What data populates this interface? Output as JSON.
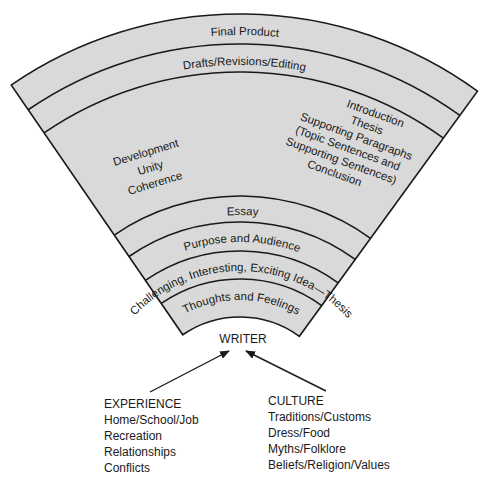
{
  "diagram": {
    "colors": {
      "band_fill": "#d9d9d9",
      "line": "#1a1a1a",
      "text": "#1a1a1a"
    },
    "bands_outer_to_inner": [
      {
        "id": "final-product",
        "label": "Final Product"
      },
      {
        "id": "drafts",
        "label": "Drafts/Revisions/Editing"
      },
      {
        "id": "structure",
        "label": ""
      },
      {
        "id": "essay",
        "label": "Essay"
      },
      {
        "id": "purpose",
        "label": "Purpose and Audience"
      },
      {
        "id": "idea",
        "label": "Challenging, Interesting, Exciting Idea—Thesis"
      },
      {
        "id": "thoughts",
        "label": "Thoughts and Feelings"
      }
    ],
    "structure_left": [
      "Development",
      "Unity",
      "Coherence"
    ],
    "structure_right": [
      "Introduction",
      "Thesis",
      "Supporting Paragraphs",
      "(Topic Sentences and",
      "Supporting Sentences)",
      "Conclusion"
    ],
    "center_label": "WRITER",
    "experience": {
      "title": "EXPERIENCE",
      "items": [
        "Home/School/Job",
        "Recreation",
        "Relationships",
        "Conflicts"
      ]
    },
    "culture": {
      "title": "CULTURE",
      "items": [
        "Traditions/Customs",
        "Dress/Food",
        "Myths/Folklore",
        "Beliefs/Religion/Values"
      ]
    }
  }
}
